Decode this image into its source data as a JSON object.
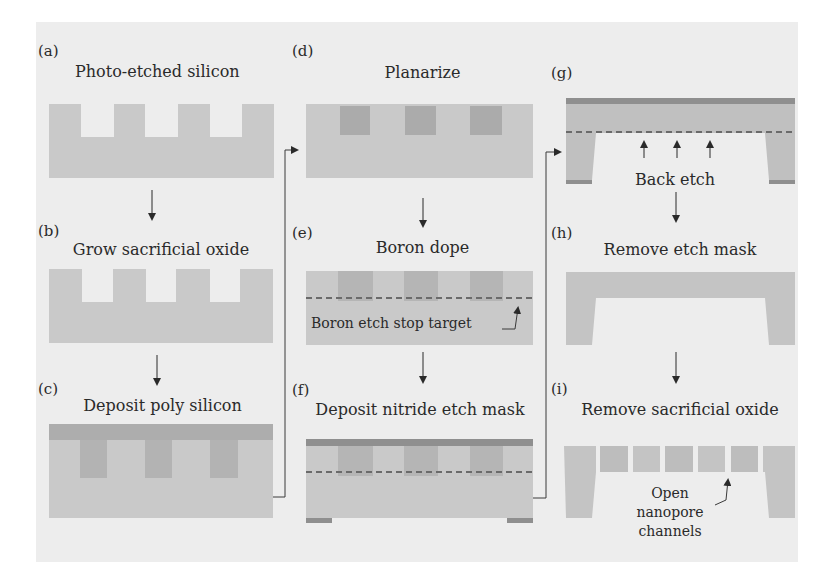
{
  "figure": {
    "colors": {
      "background": "#ededed",
      "silicon": "#c9c9c9",
      "poly": "#a9a9a9",
      "nitride": "#8f8f8f",
      "void": "#f3f3f3",
      "line": "#3a3a3a"
    },
    "panels": [
      {
        "id": "a",
        "label": "(a)",
        "title": "Photo-etched silicon"
      },
      {
        "id": "b",
        "label": "(b)",
        "title": "Grow sacrificial oxide"
      },
      {
        "id": "c",
        "label": "(c)",
        "title": "Deposit poly silicon"
      },
      {
        "id": "d",
        "label": "(d)",
        "title": "Planarize"
      },
      {
        "id": "e",
        "label": "(e)",
        "title": "Boron dope",
        "annotation": "Boron etch stop target"
      },
      {
        "id": "f",
        "label": "(f)",
        "title": "Deposit nitride etch mask"
      },
      {
        "id": "g",
        "label": "(g)",
        "title": "Back etch"
      },
      {
        "id": "h",
        "label": "(h)",
        "title": "Remove etch mask"
      },
      {
        "id": "i",
        "label": "(i)",
        "title": "Remove sacrificial oxide",
        "annotation_lines": [
          "Open",
          "nanopore",
          "channels"
        ]
      }
    ]
  }
}
